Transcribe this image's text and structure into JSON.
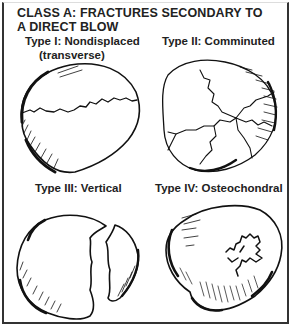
{
  "figure": {
    "title_line1": "CLASS A: FRACTURES SECONDARY TO",
    "title_line2": "A DIRECT BLOW",
    "panels": [
      {
        "label": "Type I: Nondisplaced",
        "sublabel": "(transverse)",
        "illustration": "patella-transverse-fracture"
      },
      {
        "label": "Type II: Comminuted",
        "illustration": "patella-comminuted-fracture"
      },
      {
        "label": "Type III: Vertical",
        "illustration": "patella-vertical-fracture"
      },
      {
        "label": "Type IV: Osteochondral",
        "illustration": "patella-osteochondral-fracture"
      }
    ]
  }
}
